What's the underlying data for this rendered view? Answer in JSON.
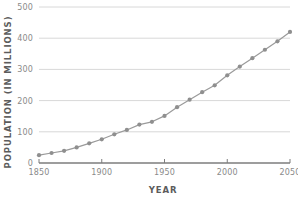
{
  "chart_data": {
    "type": "line",
    "title": "",
    "xlabel": "YEAR",
    "ylabel": "POPULATION (IN MILLIONS)",
    "xlim": [
      1850,
      2050
    ],
    "ylim": [
      0,
      500
    ],
    "xticks": [
      1850,
      1900,
      1950,
      2000,
      2050
    ],
    "xtick_labels": [
      "1850",
      "1900",
      "1950",
      "2000",
      "2050"
    ],
    "yticks": [
      0,
      100,
      200,
      300,
      400,
      500
    ],
    "ytick_labels": [
      "0",
      "100",
      "200",
      "300",
      "400",
      "500"
    ],
    "grid": "horizontal",
    "legend": "none",
    "marker": "circle",
    "line_color": "#9a9a9a",
    "marker_color": "#8f8f8f",
    "grid_color": "#d8d8d8",
    "axis_color": "#7d7d7d",
    "x": [
      1850,
      1860,
      1870,
      1880,
      1890,
      1900,
      1910,
      1920,
      1930,
      1940,
      1950,
      1960,
      1970,
      1980,
      1990,
      2000,
      2010,
      2020,
      2030,
      2040,
      2050
    ],
    "values": [
      25,
      32,
      39,
      50,
      63,
      76,
      92,
      106,
      123,
      132,
      151,
      179,
      203,
      227,
      249,
      281,
      309,
      336,
      363,
      390,
      420
    ],
    "series": [
      {
        "name": "Population",
        "values": [
          25,
          32,
          39,
          50,
          63,
          76,
          92,
          106,
          123,
          132,
          151,
          179,
          203,
          227,
          249,
          281,
          309,
          336,
          363,
          390,
          420
        ]
      }
    ]
  }
}
